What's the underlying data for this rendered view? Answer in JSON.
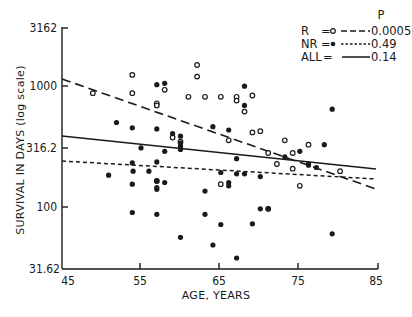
{
  "chart_data": {
    "type": "scatter",
    "title": "",
    "xlabel": "AGE, YEARS",
    "ylabel": "SURVIVAL IN DAYS (log scale)",
    "xlim": [
      45,
      85
    ],
    "ylim": [
      31.62,
      3162
    ],
    "y_scale": "log",
    "grid": false,
    "x_ticks": [
      "45",
      "55",
      "65",
      "75",
      "85"
    ],
    "y_ticks": [
      "31.62",
      "100",
      "316.2",
      "1000",
      "3162"
    ],
    "legend": {
      "position": "top-right",
      "header": "P",
      "entries": [
        {
          "label": "R",
          "marker": "open-circle",
          "line": "long-dash",
          "p": "0.0005"
        },
        {
          "label": "NR",
          "marker": "filled-circle",
          "line": "short-dash",
          "p": "0.49"
        },
        {
          "label": "ALL",
          "marker": "none",
          "line": "solid",
          "p": "0.14"
        }
      ]
    },
    "series": [
      {
        "name": "R",
        "marker": "open-circle",
        "points": [
          [
            48.9,
            910
          ],
          [
            53.9,
            1290
          ],
          [
            53.9,
            910
          ],
          [
            57.0,
            750
          ],
          [
            57.0,
            720
          ],
          [
            58.0,
            970
          ],
          [
            61.0,
            850
          ],
          [
            62.1,
            1560
          ],
          [
            62.1,
            1250
          ],
          [
            63.1,
            850
          ],
          [
            65.1,
            850
          ],
          [
            67.1,
            850
          ],
          [
            67.1,
            790
          ],
          [
            69.1,
            870
          ],
          [
            68.1,
            640
          ],
          [
            69.1,
            430
          ],
          [
            59.0,
            390
          ],
          [
            60.0,
            360
          ],
          [
            66.1,
            370
          ],
          [
            70.1,
            440
          ],
          [
            73.2,
            370
          ],
          [
            71.1,
            290
          ],
          [
            74.2,
            290
          ],
          [
            76.2,
            340
          ],
          [
            72.2,
            235
          ],
          [
            74.2,
            215
          ],
          [
            57.0,
            170
          ],
          [
            65.1,
            160
          ],
          [
            75.1,
            155
          ],
          [
            80.2,
            205
          ],
          [
            71.1,
            100
          ]
        ]
      },
      {
        "name": "NR",
        "marker": "filled-circle",
        "points": [
          [
            57.0,
            1070
          ],
          [
            58.0,
            1100
          ],
          [
            68.1,
            1040
          ],
          [
            68.1,
            720
          ],
          [
            51.9,
            520
          ],
          [
            53.9,
            470
          ],
          [
            57.0,
            460
          ],
          [
            59.0,
            420
          ],
          [
            55.0,
            320
          ],
          [
            60.0,
            400
          ],
          [
            66.1,
            450
          ],
          [
            64.1,
            480
          ],
          [
            60.0,
            350
          ],
          [
            60.0,
            330
          ],
          [
            60.0,
            310
          ],
          [
            58.0,
            300
          ],
          [
            57.0,
            245
          ],
          [
            67.1,
            260
          ],
          [
            78.2,
            340
          ],
          [
            79.2,
            670
          ],
          [
            75.1,
            300
          ],
          [
            73.2,
            270
          ],
          [
            77.2,
            220
          ],
          [
            76.2,
            235
          ],
          [
            76.2,
            230
          ],
          [
            54.0,
            205
          ],
          [
            53.9,
            240
          ],
          [
            56.0,
            205
          ],
          [
            50.9,
            190
          ],
          [
            53.9,
            160
          ],
          [
            65.1,
            200
          ],
          [
            67.1,
            195
          ],
          [
            68.1,
            195
          ],
          [
            70.1,
            185
          ],
          [
            57.0,
            170
          ],
          [
            58.0,
            165
          ],
          [
            57.0,
            150
          ],
          [
            57.0,
            145
          ],
          [
            63.1,
            140
          ],
          [
            66.1,
            165
          ],
          [
            66.1,
            155
          ],
          [
            53.9,
            93
          ],
          [
            57.0,
            90
          ],
          [
            63.1,
            90
          ],
          [
            70.1,
            100
          ],
          [
            71.1,
            100
          ],
          [
            65.1,
            74
          ],
          [
            69.1,
            75
          ],
          [
            60.0,
            58
          ],
          [
            64.1,
            50
          ],
          [
            67.1,
            39
          ],
          [
            79.2,
            62
          ]
        ]
      }
    ],
    "fit_lines": [
      {
        "name": "R",
        "style": "long-dash",
        "x": [
          45,
          84.6
        ],
        "y": [
          1155,
          155
        ]
      },
      {
        "name": "NR",
        "style": "short-dash",
        "x": [
          45,
          84.6
        ],
        "y": [
          235,
          178
        ]
      },
      {
        "name": "ALL",
        "style": "solid",
        "x": [
          45,
          84.6
        ],
        "y": [
          395,
          205
        ]
      }
    ]
  },
  "legend_labels": {
    "header": "P",
    "r_label": "R",
    "r_p": "0.0005",
    "nr_label": "NR",
    "nr_p": "0.49",
    "all_label": "ALL",
    "all_p": "0.14"
  },
  "axis_labels": {
    "x": "AGE, YEARS",
    "y": "SURVIVAL IN DAYS (log scale)",
    "x_ticks": [
      "45",
      "55",
      "65",
      "75",
      "85"
    ],
    "y_ticks": [
      "3162",
      "1000",
      "316.2",
      "100",
      "31.62"
    ]
  }
}
